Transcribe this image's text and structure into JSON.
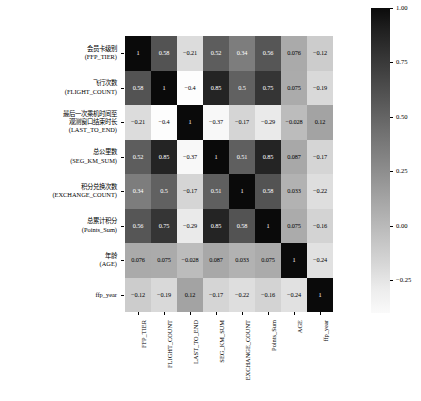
{
  "chart_data": {
    "type": "heatmap",
    "title": "",
    "xlabel": "",
    "ylabel": "",
    "grid": false,
    "annotated": true,
    "colormap": "gray_reversed",
    "x_tick_labels": [
      "FFP_TIER",
      "FLIGHT_COUNT",
      "LAST_TO_END",
      "SEG_KM_SUM",
      "EXCHANGE_COUNT",
      "Points_Sum",
      "AGE",
      "ffp_year"
    ],
    "y_tick_labels": [
      "会员卡级别\n(FFP_TIER)",
      "飞行次数\n(FLIGHT_COUNT)",
      "最后一次乘机时间至\n观测窗口结束时长\n(LAST_TO_END)",
      "总公里数\n(SEG_KM_SUM)",
      "积分兑换次数\n(EXCHANGE_COUNT)",
      "总累计积分\n(Points_Sum)",
      "年龄\n(AGE)",
      "ffp_year"
    ],
    "rows": [
      {
        "name": "FFP_TIER",
        "values": [
          1,
          0.58,
          -0.21,
          0.52,
          0.34,
          0.56,
          0.076,
          -0.12
        ],
        "labels": [
          "1",
          "0.58",
          "−0.21",
          "0.52",
          "0.34",
          "0.56",
          "0.076",
          "−0.12"
        ]
      },
      {
        "name": "FLIGHT_COUNT",
        "values": [
          0.58,
          1,
          -0.4,
          0.85,
          0.5,
          0.75,
          0.075,
          -0.19
        ],
        "labels": [
          "0.58",
          "1",
          "−0.4",
          "0.85",
          "0.5",
          "0.75",
          "0.075",
          "−0.19"
        ]
      },
      {
        "name": "LAST_TO_END",
        "values": [
          -0.21,
          -0.4,
          1,
          -0.37,
          -0.17,
          -0.29,
          -0.028,
          0.12
        ],
        "labels": [
          "−0.21",
          "−0.4",
          "1",
          "−0.37",
          "−0.17",
          "−0.29",
          "−0.028",
          "0.12"
        ]
      },
      {
        "name": "SEG_KM_SUM",
        "values": [
          0.52,
          0.85,
          -0.37,
          1,
          0.51,
          0.85,
          0.087,
          -0.17
        ],
        "labels": [
          "0.52",
          "0.85",
          "−0.37",
          "1",
          "0.51",
          "0.85",
          "0.087",
          "−0.17"
        ]
      },
      {
        "name": "EXCHANGE_COUNT",
        "values": [
          0.34,
          0.5,
          -0.17,
          0.51,
          1,
          0.58,
          0.033,
          -0.22
        ],
        "labels": [
          "0.34",
          "0.5",
          "−0.17",
          "0.51",
          "1",
          "0.58",
          "0.033",
          "−0.22"
        ]
      },
      {
        "name": "Points_Sum",
        "values": [
          0.56,
          0.75,
          -0.29,
          0.85,
          0.58,
          1,
          0.075,
          -0.16
        ],
        "labels": [
          "0.56",
          "0.75",
          "−0.29",
          "0.85",
          "0.58",
          "1",
          "0.075",
          "−0.16"
        ]
      },
      {
        "name": "AGE",
        "values": [
          0.076,
          0.075,
          -0.028,
          0.087,
          0.033,
          0.075,
          1,
          -0.24
        ],
        "labels": [
          "0.076",
          "0.075",
          "−0.028",
          "0.087",
          "0.033",
          "0.075",
          "1",
          "−0.24"
        ]
      },
      {
        "name": "ffp_year",
        "values": [
          -0.12,
          -0.19,
          0.12,
          -0.17,
          -0.22,
          -0.16,
          -0.24,
          1
        ],
        "labels": [
          "−0.12",
          "−0.19",
          "0.12",
          "−0.17",
          "−0.22",
          "−0.16",
          "−0.24",
          "1"
        ]
      }
    ],
    "colorbar": {
      "tick_labels": [
        "1.00",
        "0.75",
        "0.50",
        "0.25",
        "0.00",
        "−0.25"
      ],
      "tick_values": [
        1.0,
        0.75,
        0.5,
        0.25,
        0.0,
        -0.25
      ],
      "vmin": -0.4,
      "vmax": 1.0,
      "orientation": "vertical",
      "position": "right"
    }
  }
}
